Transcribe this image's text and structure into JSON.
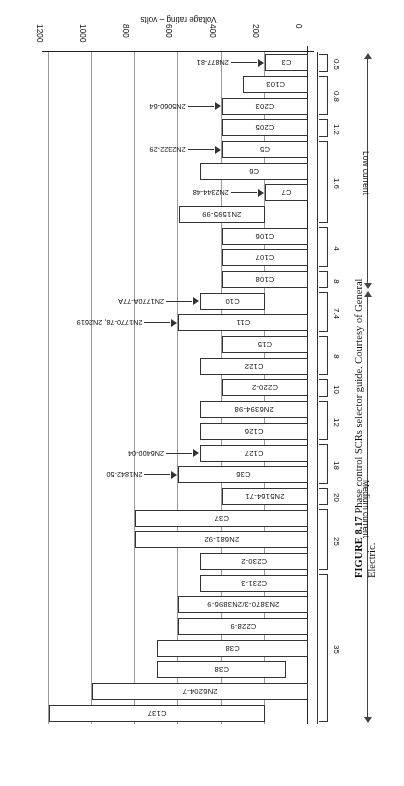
{
  "figure": {
    "number": "FIGURE 8.17",
    "caption": "Phase control SCRs selector guide. Courtesy of General Electric."
  },
  "chart_data": {
    "type": "bar",
    "orientation": "horizontal",
    "title": "Phase control SCRs selector guide",
    "xlabel": "",
    "ylabel": "Voltage rating – volts",
    "value_axis_label": "Voltage rating – volts",
    "value_ticks": [
      0,
      200,
      400,
      600,
      800,
      1000,
      1200
    ],
    "value_limits": [
      0,
      1200
    ],
    "grid": true,
    "legend": null,
    "category_axis_label": "Current rating – amperes",
    "categories": [
      "C3",
      "C103",
      "C203",
      "C205",
      "C5",
      "C6",
      "C7",
      "2N1595-99",
      "C106",
      "C107",
      "C108",
      "C10",
      "C11",
      "C15",
      "C122",
      "C220-2",
      "2N6394-98",
      "C126",
      "C127",
      "C36",
      "2N5164-71",
      "C37",
      "2N681-92",
      "C230-2",
      "C231-3",
      "2N3870-3/2N3896-9",
      "C228-9",
      "C38",
      "C38",
      "2N6204-7",
      "C137"
    ],
    "values": [
      200,
      300,
      400,
      400,
      400,
      500,
      200,
      600,
      400,
      400,
      400,
      500,
      600,
      400,
      500,
      400,
      500,
      500,
      500,
      600,
      400,
      800,
      800,
      500,
      500,
      600,
      600,
      700,
      700,
      1000,
      1200
    ],
    "bars": [
      {
        "label": "C3",
        "start": 0,
        "end": 200,
        "group": "0.5",
        "class": "Low current",
        "callout": "2N877-81"
      },
      {
        "label": "C103",
        "start": 0,
        "end": 300,
        "group": "0.8",
        "class": "Low current",
        "callout": null
      },
      {
        "label": "C203",
        "start": 0,
        "end": 400,
        "group": "0.8",
        "class": "Low current",
        "callout": "2N5060-64"
      },
      {
        "label": "C205",
        "start": 0,
        "end": 400,
        "group": "1.2",
        "class": "Low current",
        "callout": null
      },
      {
        "label": "C5",
        "start": 0,
        "end": 400,
        "group": "1.6",
        "class": "Low current",
        "callout": "2N2322-29"
      },
      {
        "label": "C6",
        "start": 0,
        "end": 500,
        "group": "1.6",
        "class": "Low current",
        "callout": null
      },
      {
        "label": "C7",
        "start": 0,
        "end": 200,
        "group": "1.6",
        "class": "Low current",
        "callout": "2N2344-48"
      },
      {
        "label": "2N1595-99",
        "start": 200,
        "end": 600,
        "group": "1.6",
        "class": "Low current",
        "callout": null
      },
      {
        "label": "C106",
        "start": 0,
        "end": 400,
        "group": "4",
        "class": "Low current",
        "callout": null
      },
      {
        "label": "C107",
        "start": 0,
        "end": 400,
        "group": "4",
        "class": "Low current",
        "callout": null
      },
      {
        "label": "C108",
        "start": 0,
        "end": 400,
        "group": "8",
        "class": "Low current",
        "callout": null
      },
      {
        "label": "C10",
        "start": 200,
        "end": 500,
        "group": "7.4",
        "class": "Medium current",
        "callout": "2N1770A-77A"
      },
      {
        "label": "C11",
        "start": 0,
        "end": 600,
        "group": "7.4",
        "class": "Medium current",
        "callout": "2N1770-78, 2N2619"
      },
      {
        "label": "C15",
        "start": 0,
        "end": 400,
        "group": "8",
        "class": "Medium current",
        "callout": null
      },
      {
        "label": "C122",
        "start": 0,
        "end": 500,
        "group": "8",
        "class": "Medium current",
        "callout": null
      },
      {
        "label": "C220-2",
        "start": 0,
        "end": 400,
        "group": "10",
        "class": "Medium current",
        "callout": null
      },
      {
        "label": "2N6394-98",
        "start": 0,
        "end": 500,
        "group": "12",
        "class": "Medium current",
        "callout": null
      },
      {
        "label": "C126",
        "start": 0,
        "end": 500,
        "group": "12",
        "class": "Medium current",
        "callout": null
      },
      {
        "label": "C127",
        "start": 0,
        "end": 500,
        "group": "18",
        "class": "Medium current",
        "callout": "2N6400-04"
      },
      {
        "label": "C36",
        "start": 0,
        "end": 600,
        "group": "18",
        "class": "Medium current",
        "callout": "2N1842-50"
      },
      {
        "label": "2N5164-71",
        "start": 0,
        "end": 400,
        "group": "20",
        "class": "Medium current",
        "callout": null
      },
      {
        "label": "C37",
        "start": 0,
        "end": 800,
        "group": "25",
        "class": "Medium current",
        "callout": null
      },
      {
        "label": "2N681-92",
        "start": 0,
        "end": 800,
        "group": "25",
        "class": "Medium current",
        "callout": null
      },
      {
        "label": "C230-2",
        "start": 0,
        "end": 500,
        "group": "25",
        "class": "Medium current",
        "callout": null
      },
      {
        "label": "C231-3",
        "start": 0,
        "end": 500,
        "group": "35",
        "class": "Medium current",
        "callout": null
      },
      {
        "label": "2N3870-3/2N3896-9",
        "start": 0,
        "end": 600,
        "group": "35",
        "class": "Medium current",
        "callout": null
      },
      {
        "label": "C228-9",
        "start": 0,
        "end": 600,
        "group": "35",
        "class": "Medium current",
        "callout": null
      },
      {
        "label": "C38",
        "start": 0,
        "end": 700,
        "group": "35",
        "class": "Medium current",
        "callout": null
      },
      {
        "label": "C38",
        "start": 100,
        "end": 700,
        "group": "35",
        "class": "Medium current",
        "callout": null
      },
      {
        "label": "2N6204-7",
        "start": 0,
        "end": 1000,
        "group": "35",
        "class": "Medium current",
        "callout": null
      },
      {
        "label": "C137",
        "start": 200,
        "end": 1200,
        "group": "35",
        "class": "Medium current",
        "callout": null
      }
    ],
    "current_groups": [
      {
        "label": "0.5",
        "first": 0,
        "last": 0
      },
      {
        "label": "0.8",
        "first": 1,
        "last": 2
      },
      {
        "label": "1.2",
        "first": 3,
        "last": 3
      },
      {
        "label": "1.6",
        "first": 4,
        "last": 7
      },
      {
        "label": "4",
        "first": 8,
        "last": 9
      },
      {
        "label": "8",
        "first": 10,
        "last": 10
      },
      {
        "label": "7.4",
        "first": 11,
        "last": 12
      },
      {
        "label": "8",
        "first": 13,
        "last": 14
      },
      {
        "label": "10",
        "first": 15,
        "last": 15
      },
      {
        "label": "12",
        "first": 16,
        "last": 17
      },
      {
        "label": "18",
        "first": 18,
        "last": 19
      },
      {
        "label": "20",
        "first": 20,
        "last": 20
      },
      {
        "label": "25",
        "first": 21,
        "last": 23
      },
      {
        "label": "35",
        "first": 24,
        "last": 30
      }
    ],
    "current_classes": [
      {
        "label": "Low current",
        "first": 0,
        "last": 10
      },
      {
        "label": "Medium current",
        "first": 11,
        "last": 30
      }
    ]
  }
}
